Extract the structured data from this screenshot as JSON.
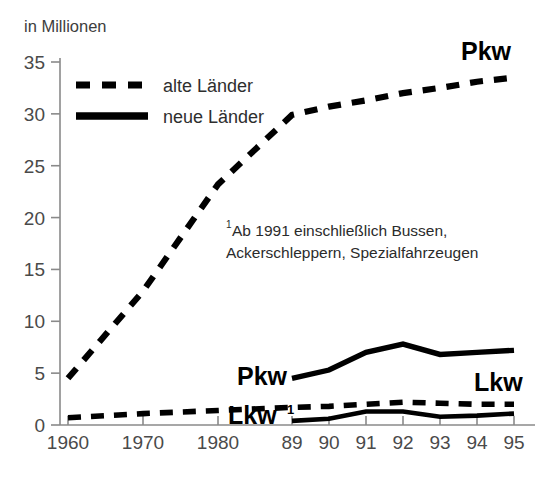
{
  "chart_data": {
    "type": "line",
    "title": "",
    "ylabel": "in Millionen",
    "xlabel": "",
    "ylim": [
      0,
      36.5
    ],
    "yticks": [
      0,
      5,
      10,
      15,
      20,
      25,
      30,
      35
    ],
    "ytick_labels": [
      "0",
      "5",
      "10",
      "15",
      "20",
      "25",
      "30",
      "35"
    ],
    "x": [
      1960,
      1970,
      1980,
      1989,
      1990,
      1991,
      1992,
      1993,
      1994,
      1995
    ],
    "xtick_labels": [
      "1960",
      "1970",
      "1980",
      "89",
      "90",
      "91",
      "92",
      "93",
      "94",
      "95"
    ],
    "grid": false,
    "legend_position": "upper-left-inside",
    "series": [
      {
        "name": "Pkw alte Länder",
        "legend": "alte Länder",
        "style": "dashed",
        "label": "Pkw",
        "x": [
          1960,
          1970,
          1980,
          1989,
          1990,
          1991,
          1992,
          1993,
          1994,
          1995
        ],
        "values": [
          4.5,
          12.9,
          23.2,
          29.9,
          30.7,
          31.3,
          32.0,
          32.5,
          33.1,
          33.5
        ]
      },
      {
        "name": "Lkw alte Länder",
        "legend": "alte Länder",
        "style": "dashed",
        "label": "Lkw",
        "label_sup": "1",
        "x": [
          1960,
          1970,
          1980,
          1989,
          1990,
          1991,
          1992,
          1993,
          1994,
          1995
        ],
        "values": [
          0.7,
          1.1,
          1.4,
          1.7,
          1.8,
          2.0,
          2.2,
          2.1,
          2.0,
          2.0
        ]
      },
      {
        "name": "Pkw neue Länder",
        "legend": "neue Länder",
        "style": "solid",
        "label": "Pkw",
        "x": [
          1989,
          1990,
          1991,
          1992,
          1993,
          1994,
          1995
        ],
        "values": [
          4.5,
          5.3,
          7.0,
          7.8,
          6.8,
          7.0,
          7.2
        ]
      },
      {
        "name": "Lkw neue Länder",
        "legend": "neue Länder",
        "style": "solid",
        "label": "Lkw",
        "x": [
          1989,
          1990,
          1991,
          1992,
          1993,
          1994,
          1995
        ],
        "values": [
          0.4,
          0.6,
          1.3,
          1.3,
          0.8,
          0.9,
          1.1
        ]
      }
    ],
    "annotations": [
      {
        "name": "footnote",
        "sup": "1",
        "line1": "Ab 1991 einschließlich Bussen,",
        "line2": "Ackerschleppern, Spezialfahrzeugen"
      }
    ]
  },
  "legend": {
    "items": [
      {
        "label": "alte Länder",
        "style": "dashed"
      },
      {
        "label": "neue Länder",
        "style": "solid"
      }
    ]
  },
  "labels": {
    "pkw_top": "Pkw",
    "pkw_mid": "Pkw",
    "lkw_right": "Lkw",
    "lkw_low": "Lkw",
    "lkw_low_sup": "1"
  },
  "colors": {
    "line": "#000000",
    "axis": "#8a8a8a",
    "tick_text": "#4a4a4a",
    "background": "#ffffff"
  }
}
